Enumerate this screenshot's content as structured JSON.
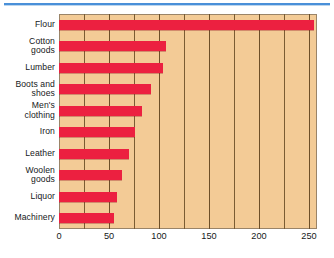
{
  "chart_data": {
    "type": "bar",
    "orientation": "horizontal",
    "title": "",
    "subtitle": "",
    "xlabel": "",
    "ylabel": "",
    "categories": [
      "Flour",
      "Cotton goods",
      "Lumber",
      "Boots and shoes",
      "Men's clothing",
      "Iron",
      "Leather",
      "Woolen goods",
      "Liquor",
      "Machinery"
    ],
    "category_lines": [
      [
        "Flour"
      ],
      [
        "Cotton",
        "goods"
      ],
      [
        "Lumber"
      ],
      [
        "Boots and",
        "shoes"
      ],
      [
        "Men's",
        "clothing"
      ],
      [
        "Iron"
      ],
      [
        "Leather"
      ],
      [
        "Woolen",
        "goods"
      ],
      [
        "Liquor"
      ],
      [
        "Machinery"
      ]
    ],
    "values": [
      255,
      107,
      104,
      92,
      83,
      76,
      70,
      63,
      58,
      55
    ],
    "xlim": [
      0,
      258
    ],
    "xticks": [
      0,
      50,
      100,
      150,
      200,
      250
    ],
    "xticklabels": [
      "0",
      "50",
      "100",
      "150",
      "200",
      "250"
    ],
    "gridlines": [
      25,
      50,
      75,
      100,
      125,
      150,
      175,
      200,
      225,
      250
    ],
    "grid": true,
    "legend": "none",
    "colors": {
      "bar": "#ec2040",
      "plot_background": "#f3cb96",
      "gridline": "#7a5c33",
      "plot_border": "#9a8468",
      "text": "#16181a",
      "top_rule": "#4a90d9",
      "page_background": "#ffffff"
    }
  }
}
